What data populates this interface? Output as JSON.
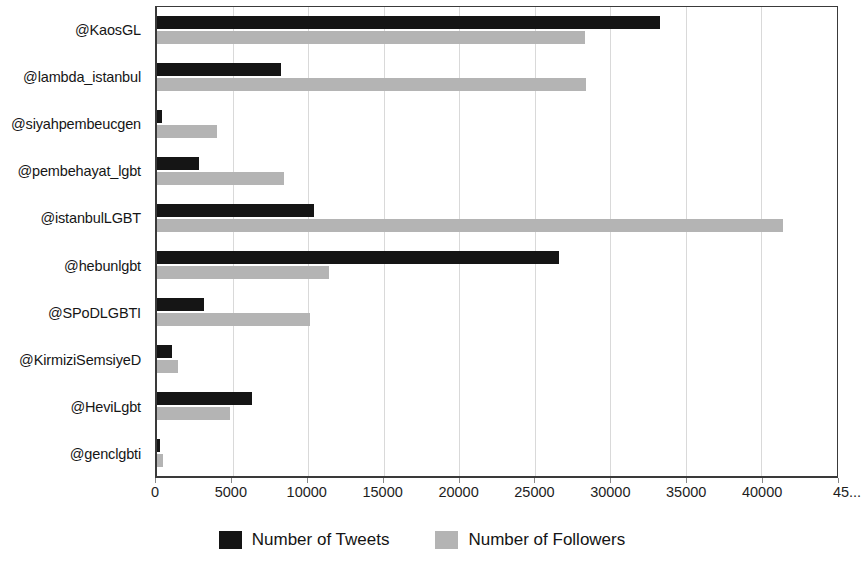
{
  "chart_data": {
    "type": "bar",
    "orientation": "horizontal",
    "title": "",
    "xlabel": "",
    "ylabel": "",
    "xlim": [
      0,
      45000
    ],
    "grid": true,
    "legend_position": "bottom",
    "xticks": [
      0,
      5000,
      10000,
      15000,
      20000,
      25000,
      30000,
      35000,
      40000,
      45000
    ],
    "xtick_labels": [
      "0",
      "5000",
      "10000",
      "15000",
      "20000",
      "25000",
      "30000",
      "35000",
      "40000",
      "45..."
    ],
    "categories": [
      "@KaosGL",
      "@lambda_istanbul",
      "@siyahpembeucgen",
      "@pembehayat_lgbt",
      "@istanbulLGBT",
      "@hebunlgbt",
      "@SPoDLGBTI",
      "@KirmiziSemsiyeD",
      "@HeviLgbt",
      "@genclgbti"
    ],
    "series": [
      {
        "name": "Number of Tweets",
        "color": "#151515",
        "values": [
          33300,
          8200,
          300,
          2800,
          10400,
          26600,
          3100,
          1000,
          6300,
          200
        ]
      },
      {
        "name": "Number of Followers",
        "color": "#b4b4b4",
        "values": [
          28300,
          28400,
          4000,
          8400,
          41400,
          11400,
          10100,
          1400,
          4800,
          400
        ]
      }
    ]
  },
  "legend": {
    "items": [
      {
        "label": "Number of Tweets",
        "swatch": "tweets"
      },
      {
        "label": "Number of Followers",
        "swatch": "followers"
      }
    ]
  }
}
